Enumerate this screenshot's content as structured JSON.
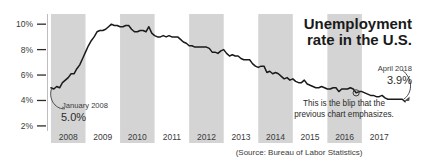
{
  "chart_data": {
    "type": "line",
    "title": "Unemployment rate in the U.S.",
    "title_line1": "Unemployment",
    "title_line2": "rate in the U.S.",
    "xlabel": "",
    "ylabel": "",
    "ylim": [
      1.6,
      10.8
    ],
    "xlim": [
      2007.9,
      2018.45
    ],
    "grid": false,
    "legend": "none",
    "source": "(Source: Bureau of Labor Statistics)",
    "yticks": [
      "2%",
      "4%",
      "6%",
      "8%",
      "10%"
    ],
    "ytick_values": [
      2,
      4,
      6,
      8,
      10
    ],
    "xticks": [
      "2008",
      "2009",
      "2010",
      "2011",
      "2012",
      "2013",
      "2014",
      "2015",
      "2016",
      "2017"
    ],
    "xtick_values": [
      2008.5,
      2009.5,
      2010.5,
      2011.5,
      2012.5,
      2013.5,
      2014.5,
      2015.5,
      2016.5,
      2017.5
    ],
    "shaded_year_bands": [
      2008,
      2010,
      2012,
      2014,
      2016
    ],
    "band_color": "#d4d4d4",
    "line_color": "#1a1a1a",
    "series": [
      {
        "name": "U.S. unemployment rate",
        "x": [
          2008.0,
          2008.083,
          2008.167,
          2008.25,
          2008.333,
          2008.417,
          2008.5,
          2008.583,
          2008.667,
          2008.75,
          2008.833,
          2008.917,
          2009.0,
          2009.083,
          2009.167,
          2009.25,
          2009.333,
          2009.417,
          2009.5,
          2009.583,
          2009.667,
          2009.75,
          2009.833,
          2009.917,
          2010.0,
          2010.083,
          2010.167,
          2010.25,
          2010.333,
          2010.417,
          2010.5,
          2010.583,
          2010.667,
          2010.75,
          2010.833,
          2010.917,
          2011.0,
          2011.083,
          2011.167,
          2011.25,
          2011.333,
          2011.417,
          2011.5,
          2011.583,
          2011.667,
          2011.75,
          2011.833,
          2011.917,
          2012.0,
          2012.083,
          2012.167,
          2012.25,
          2012.333,
          2012.417,
          2012.5,
          2012.583,
          2012.667,
          2012.75,
          2012.833,
          2012.917,
          2013.0,
          2013.083,
          2013.167,
          2013.25,
          2013.333,
          2013.417,
          2013.5,
          2013.583,
          2013.667,
          2013.75,
          2013.833,
          2013.917,
          2014.0,
          2014.083,
          2014.167,
          2014.25,
          2014.333,
          2014.417,
          2014.5,
          2014.583,
          2014.667,
          2014.75,
          2014.833,
          2014.917,
          2015.0,
          2015.083,
          2015.167,
          2015.25,
          2015.333,
          2015.417,
          2015.5,
          2015.583,
          2015.667,
          2015.75,
          2015.833,
          2015.917,
          2016.0,
          2016.083,
          2016.167,
          2016.25,
          2016.333,
          2016.417,
          2016.5,
          2016.583,
          2016.667,
          2016.75,
          2016.833,
          2016.917,
          2017.0,
          2017.083,
          2017.167,
          2017.25,
          2017.333,
          2017.417,
          2017.5,
          2017.583,
          2017.667,
          2017.75,
          2017.833,
          2017.917,
          2018.0,
          2018.083,
          2018.167,
          2018.25
        ],
        "values": [
          5.0,
          4.9,
          5.1,
          5.0,
          5.4,
          5.6,
          5.8,
          6.1,
          6.1,
          6.5,
          6.8,
          7.3,
          7.8,
          8.3,
          8.7,
          9.0,
          9.4,
          9.5,
          9.5,
          9.6,
          9.8,
          10.0,
          9.9,
          9.9,
          9.8,
          9.8,
          9.9,
          9.9,
          9.6,
          9.4,
          9.4,
          9.5,
          9.5,
          9.4,
          9.8,
          9.3,
          9.1,
          9.0,
          9.0,
          9.1,
          9.0,
          9.1,
          9.0,
          9.0,
          9.0,
          8.8,
          8.6,
          8.5,
          8.3,
          8.3,
          8.2,
          8.2,
          8.2,
          8.2,
          8.2,
          8.1,
          7.8,
          7.8,
          7.7,
          7.9,
          8.0,
          7.7,
          7.5,
          7.6,
          7.5,
          7.5,
          7.3,
          7.2,
          7.2,
          7.2,
          6.9,
          6.7,
          6.6,
          6.7,
          6.7,
          6.2,
          6.3,
          6.1,
          6.2,
          6.1,
          5.9,
          5.7,
          5.8,
          5.6,
          5.7,
          5.5,
          5.4,
          5.4,
          5.6,
          5.3,
          5.2,
          5.1,
          5.0,
          5.0,
          5.1,
          5.0,
          4.9,
          4.9,
          5.0,
          5.0,
          4.7,
          4.9,
          4.9,
          4.9,
          5.0,
          4.9,
          4.6,
          4.7,
          4.7,
          4.6,
          4.5,
          4.4,
          4.4,
          4.3,
          4.3,
          4.4,
          4.2,
          4.1,
          4.1,
          4.1,
          4.1,
          4.1,
          4.1,
          3.9
        ]
      }
    ],
    "annotations": [
      {
        "id": "start-point",
        "label_line1": "January 2008",
        "label_line2": "5.0%",
        "point_x": 2008.0,
        "point_y": 5.0
      },
      {
        "id": "end-point",
        "label_line1": "April 2018",
        "label_line2": "3.9%",
        "point_x": 2018.25,
        "point_y": 3.9
      },
      {
        "id": "blip-note",
        "label_line1": "This is the blip that the",
        "label_line2": "previous chart emphasizes.",
        "point_x": 2016.833,
        "point_y": 4.6
      }
    ]
  }
}
